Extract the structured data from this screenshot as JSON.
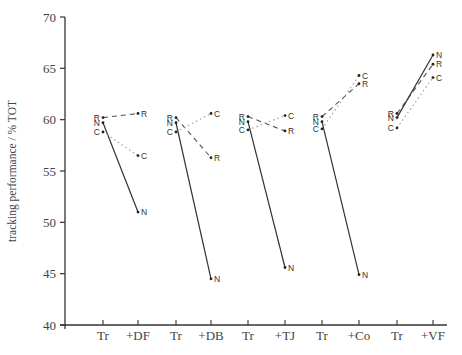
{
  "chart_data": {
    "type": "line",
    "title": "",
    "xlabel": "",
    "ylabel": "tracking performance / % TOT",
    "ylim": [
      40,
      70
    ],
    "yticks": [
      40,
      45,
      50,
      55,
      60,
      65,
      70
    ],
    "grid": false,
    "legend": "none (points labelled R, N, C directly)",
    "line_styles": {
      "R": "dashed",
      "N": "solid",
      "C": "dotted"
    },
    "categories": [
      "Tr",
      "+DF",
      "Tr",
      "+DB",
      "Tr",
      "+TJ",
      "Tr",
      "+Co",
      "Tr",
      "+VF"
    ],
    "groups": [
      {
        "from": "Tr",
        "to": "+DF",
        "series": [
          {
            "name": "R",
            "values": [
              60.2,
              60.6
            ]
          },
          {
            "name": "N",
            "values": [
              59.7,
              51.0
            ]
          },
          {
            "name": "C",
            "values": [
              58.8,
              56.5
            ]
          }
        ]
      },
      {
        "from": "Tr",
        "to": "+DB",
        "series": [
          {
            "name": "R",
            "values": [
              60.2,
              56.3
            ]
          },
          {
            "name": "N",
            "values": [
              59.7,
              44.5
            ]
          },
          {
            "name": "C",
            "values": [
              58.8,
              60.6
            ]
          }
        ]
      },
      {
        "from": "Tr",
        "to": "+TJ",
        "series": [
          {
            "name": "R",
            "values": [
              60.3,
              58.9
            ]
          },
          {
            "name": "N",
            "values": [
              59.8,
              45.6
            ]
          },
          {
            "name": "C",
            "values": [
              59.0,
              60.4
            ]
          }
        ]
      },
      {
        "from": "Tr",
        "to": "+Co",
        "series": [
          {
            "name": "R",
            "values": [
              60.3,
              63.5
            ]
          },
          {
            "name": "N",
            "values": [
              59.8,
              44.9
            ]
          },
          {
            "name": "C",
            "values": [
              59.1,
              64.3
            ]
          }
        ]
      },
      {
        "from": "Tr",
        "to": "+VF",
        "series": [
          {
            "name": "R",
            "values": [
              60.6,
              65.4
            ]
          },
          {
            "name": "N",
            "values": [
              60.2,
              66.3
            ]
          },
          {
            "name": "C",
            "values": [
              59.2,
              64.1
            ]
          }
        ]
      }
    ]
  },
  "layout": {
    "plot": {
      "x0": 65,
      "y_top": 17,
      "y_bottom": 325,
      "x_end": 447
    },
    "x_positions": [
      103,
      138,
      176,
      211,
      248,
      285,
      322,
      359,
      397,
      433
    ]
  }
}
